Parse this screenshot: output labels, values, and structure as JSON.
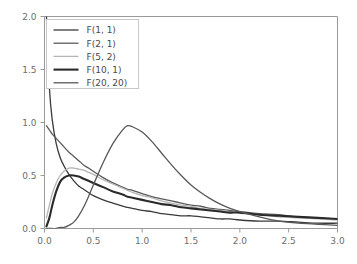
{
  "chart_data": {
    "type": "line",
    "title": "",
    "subtitle": "",
    "xlabel": "",
    "ylabel": "",
    "xlim": [
      0.0,
      3.0
    ],
    "ylim": [
      0.0,
      2.0
    ],
    "grid": false,
    "legend_position": "upper-left",
    "xticks": [
      "0.0",
      "0.5",
      "1.0",
      "1.5",
      "2.0",
      "2.5",
      "3.0"
    ],
    "xtick_values": [
      0.0,
      0.5,
      1.0,
      1.5,
      2.0,
      2.5,
      3.0
    ],
    "yticks": [
      "0.0",
      "0.5",
      "1.0",
      "1.5",
      "2.0"
    ],
    "ytick_values": [
      0.0,
      0.5,
      1.0,
      1.5,
      2.0
    ],
    "x": [
      0.02,
      0.05,
      0.08,
      0.12,
      0.16,
      0.2,
      0.25,
      0.3,
      0.35,
      0.4,
      0.45,
      0.5,
      0.6,
      0.7,
      0.8,
      0.85,
      0.9,
      1.0,
      1.1,
      1.2,
      1.3,
      1.4,
      1.5,
      1.6,
      1.7,
      1.8,
      1.9,
      2.0,
      2.2,
      2.4,
      2.6,
      2.8,
      3.0
    ],
    "series": [
      {
        "name": "F(1, 1)",
        "color": "#3a3a3a",
        "width": 1.3,
        "values": [
          2.22,
          1.33,
          1.02,
          0.8,
          0.67,
          0.59,
          0.51,
          0.45,
          0.4,
          0.37,
          0.34,
          0.31,
          0.27,
          0.24,
          0.21,
          0.2,
          0.19,
          0.17,
          0.16,
          0.14,
          0.13,
          0.12,
          0.12,
          0.11,
          0.1,
          0.09,
          0.09,
          0.08,
          0.07,
          0.07,
          0.06,
          0.05,
          0.05
        ]
      },
      {
        "name": "F(2, 1)",
        "color": "#5a5a5a",
        "width": 1.3,
        "values": [
          0.97,
          0.93,
          0.89,
          0.85,
          0.81,
          0.77,
          0.72,
          0.68,
          0.64,
          0.6,
          0.57,
          0.54,
          0.48,
          0.43,
          0.39,
          0.37,
          0.36,
          0.33,
          0.3,
          0.28,
          0.26,
          0.24,
          0.22,
          0.21,
          0.19,
          0.18,
          0.17,
          0.16,
          0.14,
          0.13,
          0.11,
          0.1,
          0.09
        ]
      },
      {
        "name": "F(5, 2)",
        "color": "#b4b4b4",
        "width": 1.3,
        "values": [
          0.1,
          0.22,
          0.33,
          0.43,
          0.5,
          0.54,
          0.57,
          0.57,
          0.56,
          0.55,
          0.53,
          0.51,
          0.46,
          0.42,
          0.38,
          0.36,
          0.34,
          0.31,
          0.29,
          0.26,
          0.24,
          0.22,
          0.21,
          0.19,
          0.18,
          0.17,
          0.16,
          0.15,
          0.13,
          0.11,
          0.1,
          0.09,
          0.08
        ]
      },
      {
        "name": "F(10, 1)",
        "color": "#2a2a2a",
        "width": 2.1,
        "values": [
          0.02,
          0.1,
          0.22,
          0.35,
          0.44,
          0.48,
          0.5,
          0.5,
          0.49,
          0.47,
          0.45,
          0.43,
          0.39,
          0.35,
          0.32,
          0.3,
          0.29,
          0.27,
          0.25,
          0.23,
          0.22,
          0.2,
          0.19,
          0.18,
          0.17,
          0.16,
          0.15,
          0.15,
          0.13,
          0.12,
          0.11,
          0.1,
          0.09
        ]
      },
      {
        "name": "F(20, 20)",
        "color": "#585858",
        "width": 1.3,
        "values": [
          0.0,
          0.0,
          0.0,
          0.0,
          0.01,
          0.01,
          0.03,
          0.06,
          0.12,
          0.2,
          0.3,
          0.41,
          0.62,
          0.8,
          0.93,
          0.97,
          0.96,
          0.91,
          0.82,
          0.71,
          0.6,
          0.5,
          0.41,
          0.34,
          0.28,
          0.23,
          0.19,
          0.16,
          0.11,
          0.07,
          0.05,
          0.04,
          0.03
        ]
      }
    ]
  },
  "legend": {
    "entries": [
      {
        "label": "F(1, 1)"
      },
      {
        "label": "F(2, 1)"
      },
      {
        "label": "F(5, 2)"
      },
      {
        "label": "F(10, 1)"
      },
      {
        "label": "F(20, 20)"
      }
    ]
  },
  "style": {
    "background": "#ffffff",
    "axis_color": "#9a9a9a",
    "tick_label_color": "#6e6e6e",
    "legend_border": "#c8c8c8",
    "legend_background": "#ffffff"
  }
}
